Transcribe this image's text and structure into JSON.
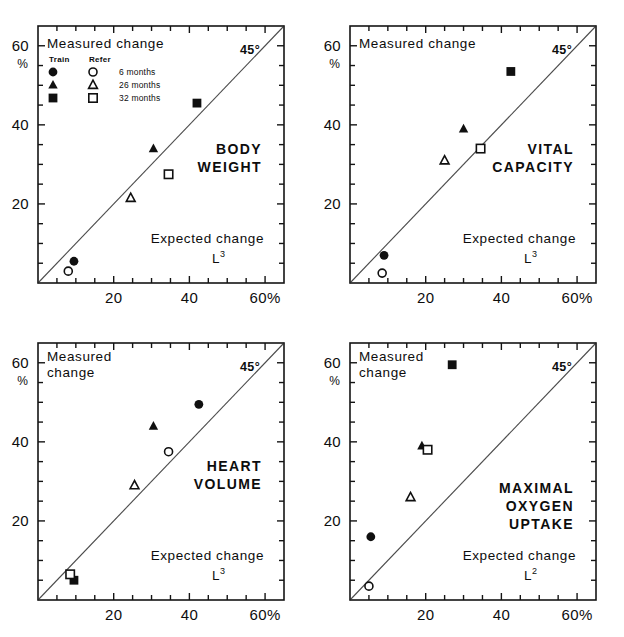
{
  "figure": {
    "axis_titles": {
      "y": "Measured change",
      "x": "Expected change",
      "y_unit": "%",
      "x_unit_pct": "60%"
    },
    "reference_line_label": "45°",
    "legend": {
      "col_train": "Train",
      "col_refer": "Refer",
      "items": [
        {
          "label": "6 months",
          "train_marker": "filled-circle",
          "refer_marker": "open-circle"
        },
        {
          "label": "26 months",
          "train_marker": "filled-triangle",
          "refer_marker": "open-triangle"
        },
        {
          "label": "32 months",
          "train_marker": "filled-square",
          "refer_marker": "open-square"
        }
      ]
    },
    "axis_ticks": {
      "x": [
        "20",
        "40",
        "60%"
      ],
      "y": [
        "20",
        "40",
        "60"
      ],
      "x_values": [
        20,
        40,
        60
      ],
      "y_values": [
        20,
        40,
        60
      ]
    }
  },
  "chart_data": [
    {
      "type": "scatter",
      "title": "BODY WEIGHT",
      "xlabel": "Expected change",
      "x_exponent_label": "L3",
      "ylabel": "Measured change",
      "xlim": [
        0,
        65
      ],
      "ylim": [
        0,
        65
      ],
      "grid": false,
      "reference_line": {
        "label": "45°",
        "slope": 1,
        "intercept": 0
      },
      "series": [
        {
          "name": "Train 6 months",
          "marker": "filled-circle",
          "points": [
            [
              9.5,
              5.5
            ]
          ]
        },
        {
          "name": "Refer 6 months",
          "marker": "open-circle",
          "points": [
            [
              8.0,
              3.0
            ]
          ]
        },
        {
          "name": "Train 26 months",
          "marker": "filled-triangle",
          "points": [
            [
              30.5,
              34.0
            ]
          ]
        },
        {
          "name": "Refer 26 months",
          "marker": "open-triangle",
          "points": [
            [
              24.5,
              21.5
            ]
          ]
        },
        {
          "name": "Train 32 months",
          "marker": "filled-square",
          "points": [
            [
              42.0,
              45.5
            ]
          ]
        },
        {
          "name": "Refer 32 months",
          "marker": "open-square",
          "points": [
            [
              34.5,
              27.5
            ]
          ]
        }
      ]
    },
    {
      "type": "scatter",
      "title": "VITAL CAPACITY",
      "xlabel": "Expected change",
      "x_exponent_label": "L3",
      "ylabel": "Measured change",
      "xlim": [
        0,
        65
      ],
      "ylim": [
        0,
        65
      ],
      "grid": false,
      "reference_line": {
        "label": "45°",
        "slope": 1,
        "intercept": 0
      },
      "series": [
        {
          "name": "Train 6 months",
          "marker": "filled-circle",
          "points": [
            [
              9.0,
              7.0
            ]
          ]
        },
        {
          "name": "Refer 6 months",
          "marker": "open-circle",
          "points": [
            [
              8.5,
              2.5
            ]
          ]
        },
        {
          "name": "Train 26 months",
          "marker": "filled-triangle",
          "points": [
            [
              30.0,
              39.0
            ]
          ]
        },
        {
          "name": "Refer 26 months",
          "marker": "open-triangle",
          "points": [
            [
              25.0,
              31.0
            ]
          ]
        },
        {
          "name": "Train 32 months",
          "marker": "filled-square",
          "points": [
            [
              42.5,
              53.5
            ]
          ]
        },
        {
          "name": "Refer 32 months",
          "marker": "open-square",
          "points": [
            [
              34.5,
              34.0
            ]
          ]
        }
      ]
    },
    {
      "type": "scatter",
      "title": "HEART VOLUME",
      "xlabel": "Expected change",
      "x_exponent_label": "L3",
      "ylabel": "Measured change",
      "xlim": [
        0,
        65
      ],
      "ylim": [
        0,
        65
      ],
      "grid": false,
      "reference_line": {
        "label": "45°",
        "slope": 1,
        "intercept": 0
      },
      "series": [
        {
          "name": "Train 6 months",
          "marker": "filled-circle",
          "points": [
            [
              42.5,
              49.5
            ]
          ]
        },
        {
          "name": "Refer 6 months",
          "marker": "open-circle",
          "points": [
            [
              34.5,
              37.5
            ]
          ]
        },
        {
          "name": "Train 26 months",
          "marker": "filled-triangle",
          "points": [
            [
              30.5,
              44.0
            ]
          ]
        },
        {
          "name": "Refer 26 months",
          "marker": "open-triangle",
          "points": [
            [
              25.5,
              29.0
            ]
          ]
        },
        {
          "name": "Train 32 months",
          "marker": "filled-square",
          "points": [
            [
              9.5,
              5.0
            ]
          ]
        },
        {
          "name": "Refer 32 months",
          "marker": "open-square",
          "points": [
            [
              8.5,
              6.5
            ]
          ]
        }
      ]
    },
    {
      "type": "scatter",
      "title": "MAXIMAL OXYGEN UPTAKE",
      "xlabel": "Expected change",
      "x_exponent_label": "L2",
      "ylabel": "Measured change",
      "xlim": [
        0,
        65
      ],
      "ylim": [
        0,
        65
      ],
      "grid": false,
      "reference_line": {
        "label": "45°",
        "slope": 1,
        "intercept": 0
      },
      "series": [
        {
          "name": "Train 6 months",
          "marker": "filled-circle",
          "points": [
            [
              5.5,
              16.0
            ]
          ]
        },
        {
          "name": "Refer 6 months",
          "marker": "open-circle",
          "points": [
            [
              5.0,
              3.5
            ]
          ]
        },
        {
          "name": "Train 26 months",
          "marker": "filled-triangle",
          "points": [
            [
              19.0,
              39.0
            ]
          ]
        },
        {
          "name": "Refer 26 months",
          "marker": "open-triangle",
          "points": [
            [
              16.0,
              26.0
            ]
          ]
        },
        {
          "name": "Train 32 months",
          "marker": "filled-square",
          "points": [
            [
              27.0,
              59.5
            ]
          ]
        },
        {
          "name": "Refer 32 months",
          "marker": "open-square",
          "points": [
            [
              20.5,
              38.0
            ]
          ]
        }
      ]
    }
  ]
}
